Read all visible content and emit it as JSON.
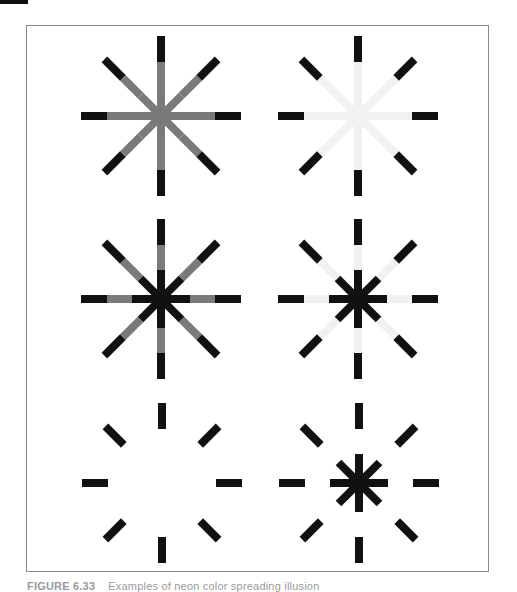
{
  "figure": {
    "caption_label": "FIGURE 6.33",
    "caption_text": "Examples of neon color spreading illusion",
    "colors": {
      "black": "#111111",
      "medium_grey": "#7a7a7a",
      "light_grey": "#f1f1f1",
      "frame": "#8a8a8a"
    },
    "panels": [
      {
        "id": "top-left",
        "cx": 161,
        "cy": 116,
        "inner": "medium_grey",
        "middle": "medium_grey",
        "outer": "black"
      },
      {
        "id": "top-right",
        "cx": 358,
        "cy": 116,
        "inner": "light_grey",
        "middle": "light_grey",
        "outer": "black"
      },
      {
        "id": "middle-left",
        "cx": 161,
        "cy": 299,
        "inner": "black",
        "middle": "medium_grey",
        "outer": "black"
      },
      {
        "id": "middle-right",
        "cx": 358,
        "cy": 299,
        "inner": "black",
        "middle": "light_grey",
        "outer": "black"
      },
      {
        "id": "bottom-left",
        "cx": 162,
        "cy": 483,
        "inner": "none",
        "middle": "none",
        "outer": "black"
      },
      {
        "id": "bottom-right",
        "cx": 359,
        "cy": 483,
        "inner": "black",
        "middle": "none",
        "outer": "black"
      }
    ],
    "ray_geometry": {
      "rays": 8,
      "inner_end": 29,
      "middle_end": 54,
      "outer_end": 80,
      "stroke_width": 8
    }
  }
}
